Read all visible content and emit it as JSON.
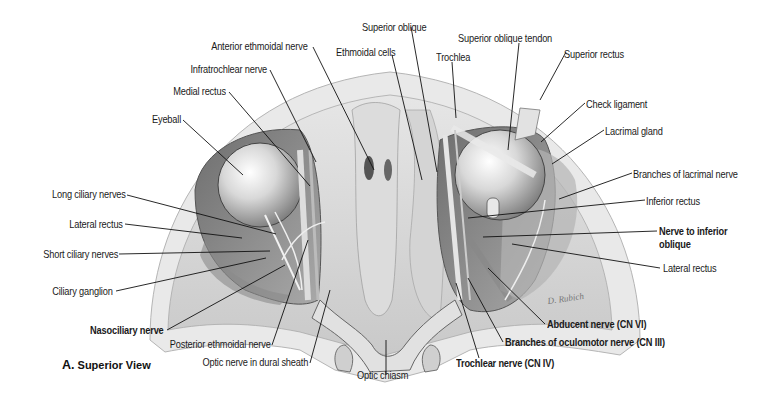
{
  "figure": {
    "caption_letter": "A.",
    "caption_text": "Superior View",
    "signature": "D. Rubich"
  },
  "labels": {
    "anterior_ethmoidal_nerve": "Anterior ethmoidal nerve",
    "infratrochlear_nerve": "Infratrochlear nerve",
    "medial_rectus": "Medial rectus",
    "eyeball": "Eyeball",
    "long_ciliary_nerves": "Long ciliary nerves",
    "lateral_rectus_left": "Lateral rectus",
    "short_ciliary_nerves": "Short ciliary nerves",
    "ciliary_ganglion": "Ciliary ganglion",
    "nasociliary_nerve": "Nasociliary nerve",
    "posterior_ethmoidal_nerve": "Posterior ethmoidal nerve",
    "optic_nerve_dural_sheath": "Optic nerve in dural sheath",
    "optic_chiasm": "Optic chiasm",
    "superior_oblique": "Superior oblique",
    "ethmoidal_cells": "Ethmoidal cells",
    "trochlea": "Trochlea",
    "superior_oblique_tendon": "Superior oblique tendon",
    "superior_rectus": "Superior rectus",
    "check_ligament": "Check ligament",
    "lacrimal_gland": "Lacrimal gland",
    "branches_lacrimal_nerve": "Branches of lacrimal nerve",
    "inferior_rectus": "Inferior rectus",
    "nerve_inferior_oblique_1": "Nerve to inferior",
    "nerve_inferior_oblique_2": "oblique",
    "lateral_rectus_right": "Lateral rectus",
    "abducent_nerve": "Abducent nerve (CN VI)",
    "branches_oculomotor": "Branches of oculomotor nerve (CN III)",
    "trochlear_nerve": "Trochlear nerve (CN IV)"
  }
}
